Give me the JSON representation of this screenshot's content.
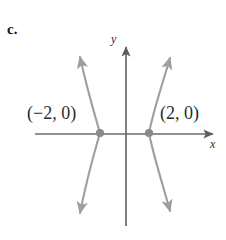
{
  "figure": {
    "part_label": "c.",
    "axes": {
      "x_label": "x",
      "y_label": "y",
      "origin_px": {
        "x": 126,
        "y": 134
      },
      "x_axis_px": {
        "x1": 35,
        "y1": 134,
        "x2": 217,
        "y2": 134
      },
      "y_axis_px": {
        "x1": 126,
        "y1": 43,
        "x2": 126,
        "y2": 226
      },
      "axis_color": "#6a6a6a",
      "arrow_heads": [
        "x-positive",
        "y-positive"
      ]
    },
    "curve": {
      "type": "hyperbola",
      "orientation": "horizontal-transverse-axis",
      "color": "#9a9a9a",
      "stroke_width": 2,
      "arrow_ends": 4,
      "branches": [
        {
          "name": "left-branch",
          "vertex_px": {
            "x": 100,
            "y": 133
          },
          "vertex_value": [
            -2,
            0
          ],
          "opens": "left"
        },
        {
          "name": "right-branch",
          "vertex_px": {
            "x": 149,
            "y": 133
          },
          "vertex_value": [
            2,
            0
          ],
          "opens": "right"
        }
      ]
    },
    "points": [
      {
        "name": "left-vertex",
        "label": "(−2, 0)",
        "coords": [
          -2,
          0
        ],
        "dot_px": {
          "x": 100,
          "y": 133
        },
        "dot_color": "#8a8a8a"
      },
      {
        "name": "right-vertex",
        "label": "(2, 0)",
        "coords": [
          2,
          0
        ],
        "dot_px": {
          "x": 149,
          "y": 133
        },
        "dot_color": "#8a8a8a"
      }
    ]
  }
}
